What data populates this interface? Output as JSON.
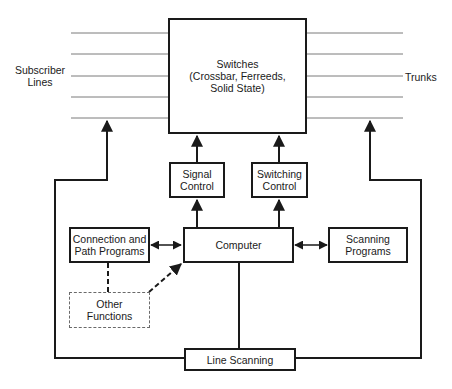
{
  "diagram": {
    "switches": {
      "label": "Switches\n(Crossbar, Ferreeds,\nSolid State)"
    },
    "signal_control": {
      "label": "Signal\nControl"
    },
    "switching_control": {
      "label": "Switching\nControl"
    },
    "computer": {
      "label": "Computer"
    },
    "connection_programs": {
      "label": "Connection and\nPath Programs"
    },
    "scanning_programs": {
      "label": "Scanning\nPrograms"
    },
    "other_functions": {
      "label": "Other\nFunctions"
    },
    "line_scanning": {
      "label": "Line Scanning"
    },
    "subscriber_lines": {
      "label": "Subscriber\nLines"
    },
    "trunks": {
      "label": "Trunks"
    }
  },
  "colors": {
    "line": "#1a1a1a",
    "thin_line": "#7a7a7a",
    "dashed": "#6a6a6a"
  }
}
